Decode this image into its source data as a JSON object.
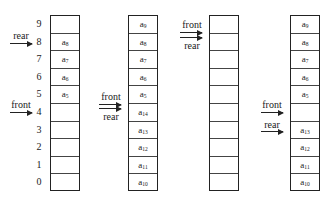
{
  "indices": [
    "9",
    "8",
    "7",
    "6",
    "5",
    "4",
    "3",
    "2",
    "1",
    "0"
  ],
  "columns": [
    {
      "name": "queue-a",
      "cells": [
        {
          "base": "",
          "sub": ""
        },
        {
          "base": "a",
          "sub": "8"
        },
        {
          "base": "a",
          "sub": "7"
        },
        {
          "base": "a",
          "sub": "6"
        },
        {
          "base": "a",
          "sub": "5"
        },
        {
          "base": "",
          "sub": ""
        },
        {
          "base": "",
          "sub": ""
        },
        {
          "base": "",
          "sub": ""
        },
        {
          "base": "",
          "sub": ""
        },
        {
          "base": "",
          "sub": ""
        }
      ],
      "pointers": {
        "rear": "rear",
        "front": "front"
      }
    },
    {
      "name": "queue-b",
      "cells": [
        {
          "base": "a",
          "sub": "9"
        },
        {
          "base": "a",
          "sub": "8"
        },
        {
          "base": "a",
          "sub": "7"
        },
        {
          "base": "a",
          "sub": "6"
        },
        {
          "base": "a",
          "sub": "5"
        },
        {
          "base": "a",
          "sub": "14"
        },
        {
          "base": "a",
          "sub": "13"
        },
        {
          "base": "a",
          "sub": "12"
        },
        {
          "base": "a",
          "sub": "11"
        },
        {
          "base": "a",
          "sub": "10"
        }
      ],
      "pointers": {
        "front": "front",
        "rear": "rear"
      }
    },
    {
      "name": "queue-c",
      "cells": [
        {
          "base": "",
          "sub": ""
        },
        {
          "base": "",
          "sub": ""
        },
        {
          "base": "",
          "sub": ""
        },
        {
          "base": "",
          "sub": ""
        },
        {
          "base": "",
          "sub": ""
        },
        {
          "base": "",
          "sub": ""
        },
        {
          "base": "",
          "sub": ""
        },
        {
          "base": "",
          "sub": ""
        },
        {
          "base": "",
          "sub": ""
        },
        {
          "base": "",
          "sub": ""
        }
      ],
      "pointers": {
        "front": "front",
        "rear": "rear"
      }
    },
    {
      "name": "queue-d",
      "cells": [
        {
          "base": "a",
          "sub": "9"
        },
        {
          "base": "a",
          "sub": "8"
        },
        {
          "base": "a",
          "sub": "7"
        },
        {
          "base": "a",
          "sub": "6"
        },
        {
          "base": "a",
          "sub": "5"
        },
        {
          "base": "",
          "sub": ""
        },
        {
          "base": "a",
          "sub": "13"
        },
        {
          "base": "a",
          "sub": "12"
        },
        {
          "base": "a",
          "sub": "11"
        },
        {
          "base": "a",
          "sub": "10"
        }
      ],
      "pointers": {
        "front": "front",
        "rear": "rear"
      }
    }
  ]
}
